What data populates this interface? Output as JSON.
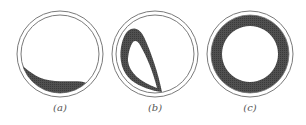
{
  "figure": {
    "panels": [
      {
        "id": "a",
        "label": "(a)",
        "description": "Circular pipe cross-section with fluid layer at bottom (stratified flow)",
        "cx": 60,
        "cy": 54
      },
      {
        "id": "b",
        "label": "(b)",
        "description": "Circular pipe cross-section with crescent/teardrop loop of fluid (transitional flow)",
        "cx": 155,
        "cy": 54
      },
      {
        "id": "c",
        "label": "(c)",
        "description": "Circular pipe cross-section with uniform annular ring of fluid (annular flow)",
        "cx": 250,
        "cy": 54
      }
    ],
    "colors": {
      "outline": "#7a7a7a",
      "fill": "#4a4a4a",
      "background": "#ffffff",
      "label": "#555555"
    }
  }
}
